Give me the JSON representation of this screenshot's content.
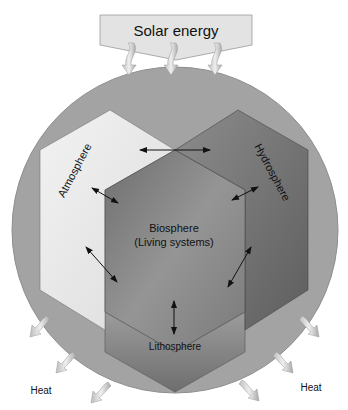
{
  "diagram": {
    "title_banner": "Solar energy",
    "nodes": [
      {
        "id": "atmosphere",
        "label": "Atmosphere",
        "color": "#e6e6e6"
      },
      {
        "id": "hydrosphere",
        "label": "Hydrosphere",
        "color": "#7a7a7a"
      },
      {
        "id": "biosphere",
        "label": "Biosphere",
        "sublabel": "(Living systems)",
        "color": "#8a8a8a"
      },
      {
        "id": "lithosphere",
        "label": "Lithosphere",
        "color": "#9a9a9a"
      }
    ],
    "heat_labels": {
      "left": "Heat",
      "right": "Heat"
    },
    "colors": {
      "earth_circle": "#a3a3a3",
      "banner": "#e3e3e3",
      "arrow": "#d8d8d8"
    }
  }
}
